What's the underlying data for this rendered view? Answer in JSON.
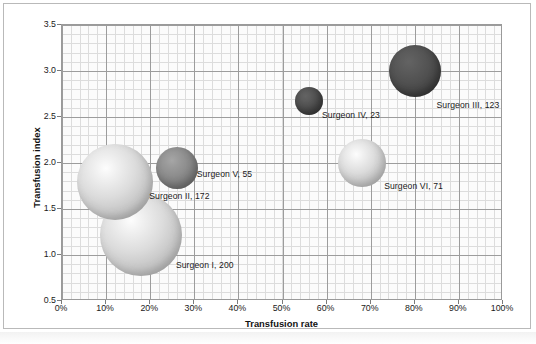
{
  "chart_data": {
    "type": "scatter",
    "title": "",
    "xlabel": "Transfusion rate",
    "ylabel": "Transfusion index",
    "xlim": [
      0,
      100
    ],
    "ylim": [
      0.5,
      3.5
    ],
    "xtick_labels": [
      "0%",
      "10%",
      "20%",
      "30%",
      "40%",
      "50%",
      "60%",
      "70%",
      "80%",
      "90%",
      "100%"
    ],
    "xtick_values": [
      0,
      10,
      20,
      30,
      40,
      50,
      60,
      70,
      80,
      90,
      100
    ],
    "ytick_labels": [
      "0.5",
      "1.0",
      "1.5",
      "2.0",
      "2.5",
      "3.0",
      "3.5"
    ],
    "ytick_values": [
      0.5,
      1.0,
      1.5,
      2.0,
      2.5,
      3.0,
      3.5
    ],
    "grid": true,
    "minor_grid": true,
    "legend": "none",
    "bubble_size_field": "cases",
    "points": [
      {
        "label": "Surgeon I, 200",
        "name": "Surgeon I",
        "cases": 200,
        "x": 18,
        "y": 1.22,
        "radius_px": 41,
        "shade": "light"
      },
      {
        "label": "Surgeon II, 172",
        "name": "Surgeon II",
        "cases": 172,
        "x": 12,
        "y": 1.79,
        "radius_px": 38,
        "shade": "light"
      },
      {
        "label": "Surgeon III, 123",
        "name": "Surgeon III",
        "cases": 123,
        "x": 80,
        "y": 3.0,
        "radius_px": 26,
        "shade": "dark"
      },
      {
        "label": "Surgeon IV, 23",
        "name": "Surgeon IV",
        "cases": 23,
        "x": 56,
        "y": 2.67,
        "radius_px": 14,
        "shade": "dark"
      },
      {
        "label": "Surgeon V, 55",
        "name": "Surgeon V",
        "cases": 55,
        "x": 26,
        "y": 1.95,
        "radius_px": 21,
        "shade": "mid"
      },
      {
        "label": "Surgeon VI, 71",
        "name": "Surgeon VI",
        "cases": 71,
        "x": 68,
        "y": 2.0,
        "radius_px": 24,
        "shade": "light"
      }
    ],
    "colors": {
      "light_bubble": "#dcdcdc",
      "mid_bubble": "#8b8b8b",
      "dark_bubble": "#4a4a4a",
      "plot_background": "#fbfbfb",
      "major_gridline": "#9c9c9c",
      "minor_gridline": "#dcdcdc",
      "frame_border": "#b9b9b9",
      "text": "#1a1a1a"
    }
  }
}
